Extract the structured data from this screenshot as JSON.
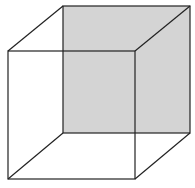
{
  "diagram": {
    "colors": {
      "edge": "#222222",
      "back_face_fill": "#d4d4d4",
      "background": "#ffffff"
    },
    "faces": [
      {
        "name": "back-face",
        "shaded": true
      },
      {
        "name": "front-face",
        "shaded": false
      }
    ],
    "edges_count": 12
  }
}
